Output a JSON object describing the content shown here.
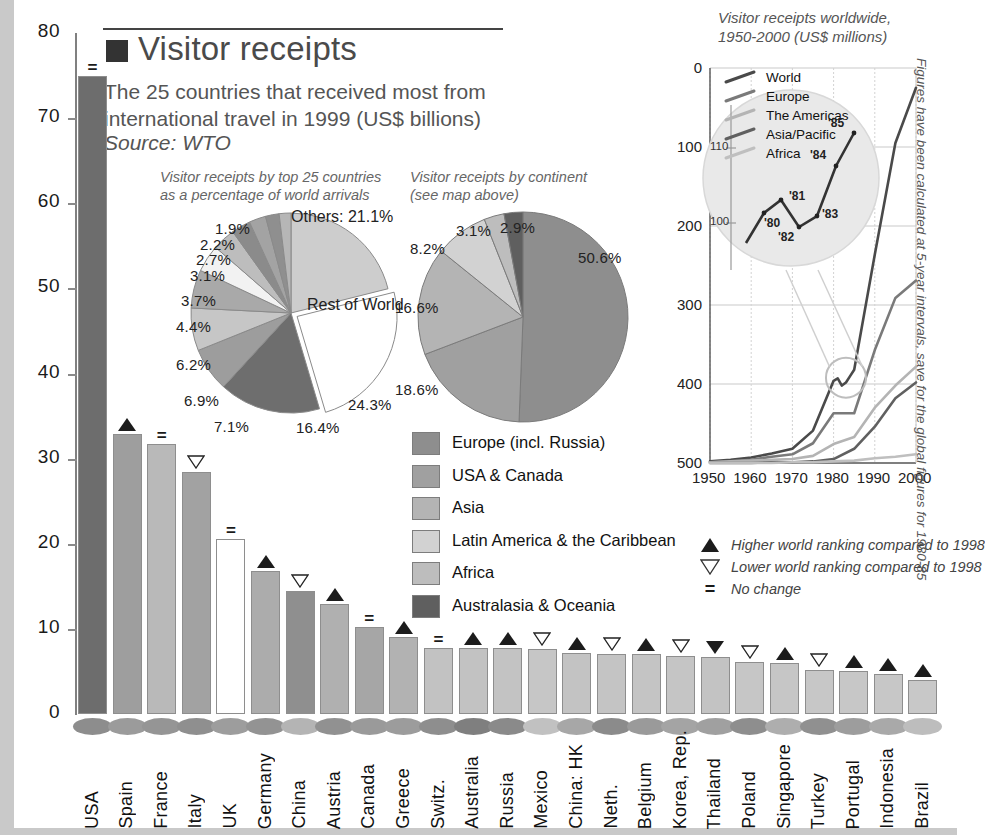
{
  "header": {
    "title": "Visitor receipts",
    "subtitle": "The 25 countries that received most from international travel in 1999 (US$ billions)",
    "source": "Source: WTO",
    "marker_square": "#333333"
  },
  "chart_data": [
    {
      "type": "bar",
      "title": "Visitor receipts",
      "subtitle": "The 25 countries that received most from international travel in 1999 (US$ billions)",
      "xlabel": "",
      "ylabel": "US$ billions",
      "ylim": [
        0,
        80
      ],
      "yticks": [
        0,
        10,
        20,
        30,
        40,
        50,
        60,
        70,
        80
      ],
      "grid": false,
      "categories": [
        "USA",
        "Spain",
        "France",
        "Italy",
        "UK",
        "Germany",
        "China",
        "Austria",
        "Canada",
        "Greece",
        "Switz.",
        "Australia",
        "Russia",
        "Mexico",
        "China: HK",
        "Neth.",
        "Belgium",
        "Korea, Rep.",
        "Thailand",
        "Poland",
        "Singapore",
        "Turkey",
        "Portugal",
        "Indonesia",
        "Brazil"
      ],
      "values": [
        74.9,
        32.9,
        31.7,
        28.4,
        20.6,
        16.8,
        14.4,
        12.9,
        10.2,
        9.1,
        7.8,
        7.8,
        7.7,
        7.6,
        7.2,
        7.1,
        7.0,
        6.8,
        6.7,
        6.1,
        6.0,
        5.2,
        5.1,
        4.7,
        4.0
      ],
      "markers": [
        "=",
        "up",
        "=",
        "down",
        "=",
        "up",
        "down",
        "up",
        "=",
        "up",
        "=",
        "up",
        "up",
        "down",
        "up",
        "down",
        "up",
        "down",
        "down-filled",
        "down",
        "up",
        "down",
        "up",
        "up",
        "up"
      ],
      "bar_colors": [
        "#6d6d6d",
        "#9e9e9e",
        "#b9b9b9",
        "#a2a2a2",
        "#ffffff",
        "#acacac",
        "#8f8f8f",
        "#b0b0b0",
        "#a6a6a6",
        "#b2b2b2",
        "#c2c2c2",
        "#c2c2c2",
        "#c3c3c3",
        "#c6c6c6",
        "#c3c3c3",
        "#c4c4c4",
        "#c4c4c4",
        "#c5c5c5",
        "#c3c3c3",
        "#c6c6c6",
        "#c6c6c6",
        "#c7c7c7",
        "#c7c7c7",
        "#c7c7c7",
        "#c8c8c8"
      ],
      "dot_colors": [
        "#8d8d8d",
        "#9b9b9b",
        "#959595",
        "#8f8f8f",
        "#9d9d9d",
        "#939393",
        "#b4b4b4",
        "#919191",
        "#9a9a9a",
        "#9c9c9c",
        "#8e8e8e",
        "#7f7f7f",
        "#8a8a8a",
        "#c1c1c1",
        "#a7a7a7",
        "#8b8b8b",
        "#9a9a9a",
        "#a4a4a4",
        "#a0a0a0",
        "#8e8e8e",
        "#aeaeae",
        "#909090",
        "#9d9d9d",
        "#a9a9a9",
        "#bdbdbd"
      ]
    },
    {
      "type": "pie",
      "title": "Visitor receipts by top 25 countries as a percentage of world arrivals",
      "labels": [
        "Others",
        "Rest of World",
        "24.3%",
        "16.4%",
        "7.1%",
        "6.9%",
        "6.2%",
        "4.4%",
        "3.7%",
        "3.1%",
        "2.7%",
        "2.2%",
        "1.9%"
      ],
      "others_label": "Others: 21.1%",
      "rest_label": "Rest of World",
      "values": [
        21.1,
        24.3,
        16.4,
        7.1,
        6.9,
        6.2,
        4.4,
        3.7,
        3.1,
        2.7,
        2.2,
        1.9
      ],
      "value_labels": [
        "21.1%",
        "24.3%",
        "16.4%",
        "7.1%",
        "6.9%",
        "6.2%",
        "4.4%",
        "3.7%",
        "3.1%",
        "2.7%",
        "2.2%",
        "1.9%"
      ],
      "colors": [
        "#cdcdcd",
        "#ffffff",
        "#6e6e6e",
        "#9d9d9d",
        "#c6c6c6",
        "#a9a9a9",
        "#f2f2f2",
        "#bdbdbd",
        "#8b8b8b",
        "#a3a3a3",
        "#8f8f8f",
        "#b6b6b6"
      ]
    },
    {
      "type": "pie",
      "title": "Visitor receipts by continent (see map above)",
      "labels": [
        "Europe (incl. Russia)",
        "USA & Canada",
        "Asia",
        "Latin America & the Caribbean",
        "Africa",
        "Australasia & Oceania"
      ],
      "values": [
        50.6,
        18.6,
        16.6,
        8.2,
        3.1,
        2.9
      ],
      "value_labels": [
        "50.6%",
        "18.6%",
        "16.6%",
        "8.2%",
        "3.1%",
        "2.9%"
      ],
      "colors": [
        "#8e8e8e",
        "#a0a0a0",
        "#b4b4b4",
        "#d2d2d2",
        "#bdbdbd",
        "#5f5f5f"
      ]
    },
    {
      "type": "line",
      "title": "Visitor receipts worldwide, 1950-2000 (US$ millions)",
      "note": "Figures have been calculated at 5-year intervals, save for the global figures for 1980-85",
      "xlabel": "",
      "ylabel": "US$ millions",
      "xlim": [
        1950,
        2000
      ],
      "ylim": [
        0,
        500
      ],
      "xticks": [
        "1950",
        "1960",
        "1970",
        "1980",
        "1990",
        "2000"
      ],
      "yticks": [
        "0",
        "100",
        "200",
        "300",
        "400",
        "500"
      ],
      "grid": true,
      "legend_position": "top-left",
      "series": [
        {
          "name": "World",
          "color": "#4a4a4a",
          "x": [
            1950,
            1955,
            1960,
            1965,
            1970,
            1975,
            1980,
            1981,
            1982,
            1983,
            1984,
            1985,
            1990,
            1995,
            2000
          ],
          "values": [
            2,
            4,
            7,
            12,
            18,
            41,
            104,
            107,
            98,
            102,
            110,
            118,
            264,
            405,
            475
          ]
        },
        {
          "name": "Europe",
          "color": "#7a7a7a",
          "x": [
            1950,
            1955,
            1960,
            1965,
            1970,
            1975,
            1980,
            1985,
            1990,
            1995,
            2000
          ],
          "values": [
            1,
            2,
            4,
            8,
            11,
            25,
            63,
            63,
            143,
            209,
            231
          ]
        },
        {
          "name": "The Americas",
          "color": "#b4b4b4",
          "x": [
            1950,
            1955,
            1960,
            1965,
            1970,
            1975,
            1980,
            1985,
            1990,
            1995,
            2000
          ],
          "values": [
            1,
            2,
            3,
            4,
            5,
            9,
            24,
            33,
            70,
            98,
            122
          ]
        },
        {
          "name": "Asia/Pacific",
          "color": "#606060",
          "x": [
            1950,
            1955,
            1960,
            1965,
            1970,
            1975,
            1980,
            1985,
            1990,
            1995,
            2000
          ],
          "values": [
            0,
            0,
            0,
            1,
            1,
            2,
            5,
            18,
            46,
            82,
            102
          ]
        },
        {
          "name": "Africa",
          "color": "#bfbfbf",
          "x": [
            1950,
            1955,
            1960,
            1965,
            1970,
            1975,
            1980,
            1985,
            1990,
            1995,
            2000
          ],
          "values": [
            0,
            0,
            0,
            0,
            1,
            1,
            2,
            3,
            6,
            8,
            11
          ]
        }
      ],
      "magnifier": {
        "yticks": [
          "100",
          "110"
        ],
        "point_labels": [
          "'80",
          "'81",
          "'82",
          "'83",
          "'84",
          "'85"
        ],
        "points": [
          104,
          107,
          98,
          102,
          110,
          118
        ]
      }
    }
  ],
  "pies": {
    "left": {
      "caption_line1": "Visitor receipts by top 25 countries",
      "caption_line2": "as a percentage of world arrivals",
      "others": "Others: 21.1%",
      "rest": "Rest of World",
      "p1": "1.9%",
      "p2": "2.2%",
      "p3": "2.7%",
      "p4": "3.1%",
      "p5": "3.7%",
      "p6": "4.4%",
      "p7": "6.2%",
      "p8": "6.9%",
      "p9": "7.1%",
      "p10": "16.4%",
      "p11": "24.3%"
    },
    "right": {
      "caption_line1": "Visitor receipts by continent",
      "caption_line2": "(see map above)",
      "p1": "50.6%",
      "p2": "18.6%",
      "p3": "16.6%",
      "p4": "8.2%",
      "p5": "3.1%",
      "p6": "2.9%"
    }
  },
  "continent_legend": [
    {
      "label": "Europe (incl. Russia)",
      "color": "#8e8e8e"
    },
    {
      "label": "USA & Canada",
      "color": "#a0a0a0"
    },
    {
      "label": "Asia",
      "color": "#b4b4b4"
    },
    {
      "label": "Latin America & the Caribbean",
      "color": "#d2d2d2"
    },
    {
      "label": "Africa",
      "color": "#bdbdbd"
    },
    {
      "label": "Australasia & Oceania",
      "color": "#5f5f5f"
    }
  ],
  "rank_key": [
    {
      "glyph": "up",
      "label": "Higher world ranking compared to 1998"
    },
    {
      "glyph": "down",
      "label": "Lower world ranking compared to 1998"
    },
    {
      "glyph": "eq",
      "label": "No change"
    }
  ],
  "line_chart": {
    "title_line1": "Visitor receipts worldwide,",
    "title_line2": "1950-2000 (US$ millions)",
    "note": "Figures have been calculated at 5-year intervals, save for the global figures for 1980-85",
    "legend": [
      "World",
      "Europe",
      "The Americas",
      "Asia/Pacific",
      "Africa"
    ],
    "yticks": [
      "500",
      "400",
      "300",
      "200",
      "100",
      "0"
    ],
    "xticks": [
      "1950",
      "1960",
      "1970",
      "1980",
      "1990",
      "2000"
    ],
    "magnifier_y": [
      "110",
      "100"
    ],
    "magnifier_points": [
      "'80",
      "'81",
      "'82",
      "'83",
      "'84",
      "'85"
    ]
  }
}
